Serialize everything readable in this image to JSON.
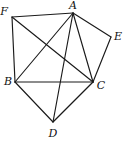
{
  "figure": {
    "kind": "geometry-diagram",
    "width": 125,
    "height": 144,
    "background_color": "#ffffff",
    "stroke_color": "#1a1a1a",
    "label_color": "#111111",
    "vertices": [
      {
        "id": "A",
        "label": "A",
        "x": 73,
        "y": 13,
        "label_x": 73,
        "label_y": 5
      },
      {
        "id": "B",
        "label": "B",
        "x": 15,
        "y": 82,
        "label_x": 8,
        "label_y": 81
      },
      {
        "id": "C",
        "label": "C",
        "x": 93,
        "y": 82,
        "label_x": 101,
        "label_y": 85
      },
      {
        "id": "D",
        "label": "D",
        "x": 53,
        "y": 122,
        "label_x": 53,
        "label_y": 133
      },
      {
        "id": "E",
        "label": "E",
        "x": 111,
        "y": 37,
        "label_x": 118,
        "label_y": 36
      },
      {
        "id": "F",
        "label": "F",
        "x": 12,
        "y": 17,
        "label_x": 4,
        "label_y": 11
      }
    ],
    "edges": [
      {
        "from": "F",
        "to": "A",
        "kind": "perimeter"
      },
      {
        "from": "A",
        "to": "E",
        "kind": "perimeter"
      },
      {
        "from": "E",
        "to": "C",
        "kind": "perimeter"
      },
      {
        "from": "C",
        "to": "D",
        "kind": "perimeter"
      },
      {
        "from": "D",
        "to": "B",
        "kind": "perimeter"
      },
      {
        "from": "B",
        "to": "F",
        "kind": "perimeter"
      },
      {
        "from": "A",
        "to": "B",
        "kind": "diagonal"
      },
      {
        "from": "A",
        "to": "C",
        "kind": "diagonal"
      },
      {
        "from": "A",
        "to": "D",
        "kind": "diagonal"
      },
      {
        "from": "F",
        "to": "C",
        "kind": "diagonal"
      },
      {
        "from": "B",
        "to": "C",
        "kind": "diagonal"
      }
    ]
  }
}
